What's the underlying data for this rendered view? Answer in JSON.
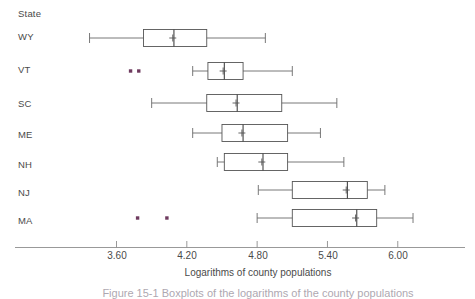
{
  "chart_data": {
    "type": "box",
    "title": "",
    "xlabel": "Logarithms of county populations",
    "ylabel": "State",
    "orientation": "horizontal",
    "grid": false,
    "legend": null,
    "xlim": [
      3.18,
      6.57
    ],
    "xticks": [
      3.6,
      4.2,
      4.8,
      5.4,
      6.0
    ],
    "xtick_labels": [
      "3.60",
      "4.20",
      "4.80",
      "5.40",
      "6.00"
    ],
    "categories": [
      "WY",
      "VT",
      "SC",
      "ME",
      "NH",
      "NJ",
      "MA"
    ],
    "marker_note": "plus sign marks the mean, vertical line marks the median",
    "series": [
      {
        "name": "WY",
        "whisker_low": 3.37,
        "q1": 3.83,
        "median": 4.09,
        "mean": 4.08,
        "q3": 4.37,
        "whisker_high": 4.87,
        "outliers": []
      },
      {
        "name": "VT",
        "whisker_low": 4.25,
        "q1": 4.38,
        "median": 4.52,
        "mean": 4.51,
        "q3": 4.68,
        "whisker_high": 5.1,
        "outliers": [
          3.72,
          3.79
        ]
      },
      {
        "name": "SC",
        "whisker_low": 3.9,
        "q1": 4.37,
        "median": 4.63,
        "mean": 4.62,
        "q3": 5.01,
        "whisker_high": 5.48,
        "outliers": []
      },
      {
        "name": "ME",
        "whisker_low": 4.25,
        "q1": 4.5,
        "median": 4.68,
        "mean": 4.67,
        "q3": 5.06,
        "whisker_high": 5.34,
        "outliers": []
      },
      {
        "name": "NH",
        "whisker_low": 4.46,
        "q1": 4.52,
        "median": 4.85,
        "mean": 4.84,
        "q3": 5.06,
        "whisker_high": 5.54,
        "outliers": []
      },
      {
        "name": "NJ",
        "whisker_low": 4.81,
        "q1": 5.1,
        "median": 5.57,
        "mean": 5.56,
        "q3": 5.74,
        "whisker_high": 5.89,
        "outliers": []
      },
      {
        "name": "MA",
        "whisker_low": 4.8,
        "q1": 5.1,
        "median": 5.65,
        "mean": 5.64,
        "q3": 5.82,
        "whisker_high": 6.13,
        "outliers": [
          3.78,
          4.03
        ]
      }
    ]
  },
  "axis": {
    "y_header": "State",
    "x_title": "Logarithms of county populations",
    "tick_labels": [
      "3.60",
      "4.20",
      "4.80",
      "5.40",
      "6.00"
    ]
  },
  "caption": {
    "text": "Figure 15-1  Boxplots of the logarithms of the county populations"
  },
  "colors": {
    "outlier": "#6e3a5e",
    "box_stroke": "#555555",
    "axis": "#8d8d8d",
    "text": "#4a4a4a"
  }
}
